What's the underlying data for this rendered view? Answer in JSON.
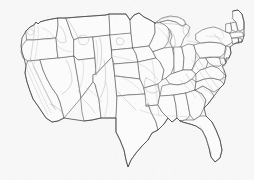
{
  "figure": {
    "kind": "map",
    "region": "United States (lower 48)",
    "projection_hint": "albers-like conic",
    "background_color": "#f7f7f7",
    "state_fill_color": "#fbfbfb",
    "state_border_color": "#4d4d4d",
    "nation_border_color": "#3f3f3f",
    "contour_color": "#a8a8a8",
    "has_labels": false,
    "has_legend": false,
    "has_frame": false,
    "layers": [
      {
        "name": "state-boundaries",
        "style": "dark thin outline",
        "color": "#4d4d4d"
      },
      {
        "name": "national-coastline",
        "style": "dark outline",
        "color": "#3f3f3f"
      },
      {
        "name": "terrain-contours",
        "style": "light gray curves",
        "color": "#a8a8a8"
      }
    ],
    "extent_px": {
      "left": 13,
      "top": 10,
      "right": 241,
      "bottom": 168
    }
  },
  "states": [
    {
      "code": "WA",
      "name": "Washington"
    },
    {
      "code": "OR",
      "name": "Oregon"
    },
    {
      "code": "CA",
      "name": "California"
    },
    {
      "code": "NV",
      "name": "Nevada"
    },
    {
      "code": "ID",
      "name": "Idaho"
    },
    {
      "code": "MT",
      "name": "Montana"
    },
    {
      "code": "WY",
      "name": "Wyoming"
    },
    {
      "code": "UT",
      "name": "Utah"
    },
    {
      "code": "AZ",
      "name": "Arizona"
    },
    {
      "code": "CO",
      "name": "Colorado"
    },
    {
      "code": "NM",
      "name": "New Mexico"
    },
    {
      "code": "ND",
      "name": "North Dakota"
    },
    {
      "code": "SD",
      "name": "South Dakota"
    },
    {
      "code": "NE",
      "name": "Nebraska"
    },
    {
      "code": "KS",
      "name": "Kansas"
    },
    {
      "code": "OK",
      "name": "Oklahoma"
    },
    {
      "code": "TX",
      "name": "Texas"
    },
    {
      "code": "MN",
      "name": "Minnesota"
    },
    {
      "code": "IA",
      "name": "Iowa"
    },
    {
      "code": "MO",
      "name": "Missouri"
    },
    {
      "code": "AR",
      "name": "Arkansas"
    },
    {
      "code": "LA",
      "name": "Louisiana"
    },
    {
      "code": "WI",
      "name": "Wisconsin"
    },
    {
      "code": "IL",
      "name": "Illinois"
    },
    {
      "code": "MI",
      "name": "Michigan"
    },
    {
      "code": "IN",
      "name": "Indiana"
    },
    {
      "code": "OH",
      "name": "Ohio"
    },
    {
      "code": "KY",
      "name": "Kentucky"
    },
    {
      "code": "TN",
      "name": "Tennessee"
    },
    {
      "code": "MS",
      "name": "Mississippi"
    },
    {
      "code": "AL",
      "name": "Alabama"
    },
    {
      "code": "GA",
      "name": "Georgia"
    },
    {
      "code": "FL",
      "name": "Florida"
    },
    {
      "code": "SC",
      "name": "South Carolina"
    },
    {
      "code": "NC",
      "name": "North Carolina"
    },
    {
      "code": "VA",
      "name": "Virginia"
    },
    {
      "code": "WV",
      "name": "West Virginia"
    },
    {
      "code": "MD",
      "name": "Maryland"
    },
    {
      "code": "DE",
      "name": "Delaware"
    },
    {
      "code": "PA",
      "name": "Pennsylvania"
    },
    {
      "code": "NJ",
      "name": "New Jersey"
    },
    {
      "code": "NY",
      "name": "New York"
    },
    {
      "code": "CT",
      "name": "Connecticut"
    },
    {
      "code": "RI",
      "name": "Rhode Island"
    },
    {
      "code": "MA",
      "name": "Massachusetts"
    },
    {
      "code": "VT",
      "name": "Vermont"
    },
    {
      "code": "NH",
      "name": "New Hampshire"
    },
    {
      "code": "ME",
      "name": "Maine"
    }
  ],
  "water_features": [
    {
      "name": "Lake Superior"
    },
    {
      "name": "Lake Michigan"
    },
    {
      "name": "Lake Huron"
    },
    {
      "name": "Lake Erie"
    },
    {
      "name": "Lake Ontario"
    },
    {
      "name": "Chesapeake Bay"
    },
    {
      "name": "Gulf of Mexico coast"
    }
  ]
}
